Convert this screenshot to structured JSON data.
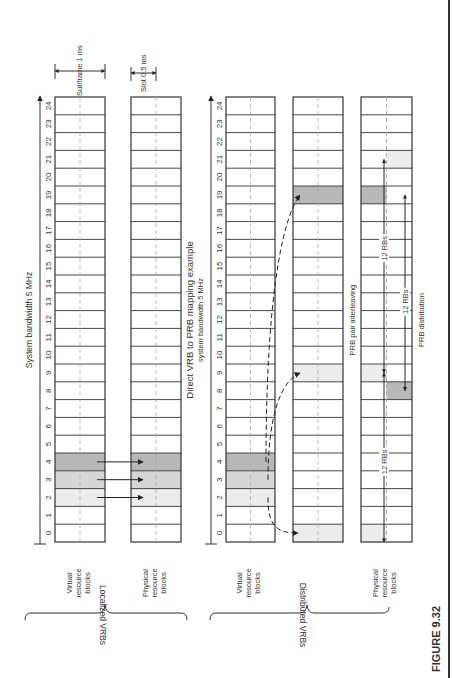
{
  "figure": {
    "number_label": "FIGURE 9.32",
    "orientation": "rotated -90deg (read bottom-to-top)"
  },
  "localized": {
    "group_label": "Localized VRBs",
    "title": "System bandwidth 5 MHz",
    "vrb_label": "Virtual resource blocks",
    "prb_label": "Physical resource blocks",
    "subframe_label": "Subframe 1 ms",
    "slot_label": "Slot 0.5 ms",
    "block_indices": [
      "0",
      "1",
      "2",
      "3",
      "4",
      "5",
      "6",
      "7",
      "8",
      "9",
      "10",
      "11",
      "12",
      "13",
      "14",
      "15",
      "16",
      "17",
      "18",
      "19",
      "20",
      "21",
      "22",
      "23",
      "24"
    ],
    "vrb_shaded": [
      {
        "index": 2,
        "shade": "light"
      },
      {
        "index": 3,
        "shade": "medium"
      },
      {
        "index": 4,
        "shade": "dark"
      }
    ],
    "prb_shaded": [
      {
        "index": 2,
        "shade": "light"
      },
      {
        "index": 3,
        "shade": "medium"
      },
      {
        "index": 4,
        "shade": "dark"
      }
    ],
    "mappings": [
      {
        "from": 2,
        "to": 2
      },
      {
        "from": 3,
        "to": 3
      },
      {
        "from": 4,
        "to": 4
      }
    ]
  },
  "distributed": {
    "group_label": "Distributed VRBs",
    "title_line1": "Direct VRB to PRB mapping example",
    "title_line2": "system bandwidth 5 MHz",
    "vrb_label": "Virtual resource blocks",
    "prb_label": "Physical resource blocks",
    "interleaving_label": "PRB pair interleaving",
    "distribution_label": "PRB distribution",
    "gap_labels": [
      "12 RBs",
      "12 RBs",
      "12 RBs"
    ],
    "block_indices": [
      "0",
      "1",
      "2",
      "3",
      "4",
      "5",
      "6",
      "7",
      "8",
      "9",
      "10",
      "11",
      "12",
      "13",
      "14",
      "15",
      "16",
      "17",
      "18",
      "19",
      "20",
      "21",
      "22",
      "23",
      "24"
    ],
    "vrb_shaded": [
      {
        "index": 2,
        "shade": "light"
      },
      {
        "index": 3,
        "shade": "medium"
      },
      {
        "index": 4,
        "shade": "dark"
      }
    ],
    "interleaved_shaded": [
      {
        "index": 0,
        "shade": "light"
      },
      {
        "index": 9,
        "shade": "light"
      },
      {
        "index": 19,
        "shade": "dark"
      }
    ],
    "distribution_shaded": [
      {
        "index": 0,
        "slot": 1,
        "shade": "light"
      },
      {
        "index": 8,
        "slot": 2,
        "shade": "dark"
      },
      {
        "index": 9,
        "slot": 1,
        "shade": "light"
      },
      {
        "index": 19,
        "slot": 1,
        "shade": "dark"
      },
      {
        "index": 21,
        "slot": 2,
        "shade": "light"
      }
    ]
  },
  "colors": {
    "light": "#ececec",
    "medium": "#d6d6d6",
    "dark": "#b8b8b8",
    "line": "#333333",
    "dashed": "#aaaaaa"
  }
}
